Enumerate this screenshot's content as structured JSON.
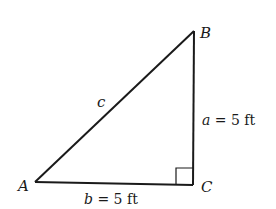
{
  "diagram": {
    "type": "right-triangle",
    "vertices": {
      "A": {
        "label": "A"
      },
      "B": {
        "label": "B"
      },
      "C": {
        "label": "C"
      }
    },
    "sides": {
      "c": {
        "var": "c",
        "text": ""
      },
      "a": {
        "var": "a",
        "text": " = 5 ft"
      },
      "b": {
        "var": "b",
        "text": " = 5 ft"
      }
    },
    "right_angle_at": "C",
    "stroke_color": "#1a1a1a"
  }
}
